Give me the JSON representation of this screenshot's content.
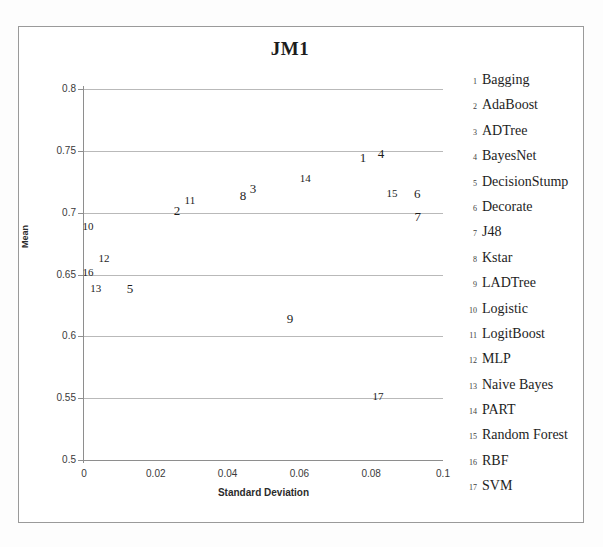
{
  "chart_data": {
    "type": "scatter",
    "title": "JM1",
    "xlabel": "Standard Deviation",
    "ylabel": "Mean",
    "xlim": [
      0,
      0.1
    ],
    "ylim": [
      0.5,
      0.8
    ],
    "xticks": [
      "0",
      "0.02",
      "0.04",
      "0.06",
      "0.08",
      "0.1"
    ],
    "xtick_values": [
      0,
      0.02,
      0.04,
      0.06,
      0.08,
      0.1
    ],
    "yticks": [
      "0.8",
      "0.75",
      "0.7",
      "0.65",
      "0.6",
      "0.55",
      "0.5"
    ],
    "ytick_values": [
      0.8,
      0.75,
      0.7,
      0.65,
      0.6,
      0.55,
      0.5
    ],
    "grid": true,
    "legend_position": "right",
    "marker_style": "numeric-label",
    "points": [
      {
        "key": "1",
        "name": "Bagging",
        "x": 0.0777,
        "y": 0.745
      },
      {
        "key": "2",
        "name": "AdaBoost",
        "x": 0.0259,
        "y": 0.702
      },
      {
        "key": "3",
        "name": "ADTree",
        "x": 0.0471,
        "y": 0.72
      },
      {
        "key": "4",
        "name": "BayesNet",
        "x": 0.0827,
        "y": 0.748
      },
      {
        "key": "5",
        "name": "DecisionStump",
        "x": 0.0128,
        "y": 0.639
      },
      {
        "key": "6",
        "name": "Decorate",
        "x": 0.0928,
        "y": 0.716
      },
      {
        "key": "7",
        "name": "J48",
        "x": 0.093,
        "y": 0.697
      },
      {
        "key": "8",
        "name": "Kstar",
        "x": 0.0443,
        "y": 0.714
      },
      {
        "key": "9",
        "name": "LADTree",
        "x": 0.0574,
        "y": 0.615
      },
      {
        "key": "10",
        "name": "Logistic",
        "x": 0.0011,
        "y": 0.689
      },
      {
        "key": "11",
        "name": "LogitBoost",
        "x": 0.0295,
        "y": 0.71
      },
      {
        "key": "12",
        "name": "MLP",
        "x": 0.0056,
        "y": 0.663
      },
      {
        "key": "13",
        "name": "Naive Bayes",
        "x": 0.0033,
        "y": 0.639
      },
      {
        "key": "14",
        "name": "PART",
        "x": 0.0616,
        "y": 0.728
      },
      {
        "key": "15",
        "name": "Random Forest",
        "x": 0.0858,
        "y": 0.716
      },
      {
        "key": "16",
        "name": "RBF",
        "x": 0.0011,
        "y": 0.652
      },
      {
        "key": "17",
        "name": "SVM",
        "x": 0.0819,
        "y": 0.552
      }
    ]
  },
  "legend": {
    "items": [
      {
        "key": "1",
        "label": "Bagging"
      },
      {
        "key": "2",
        "label": "AdaBoost"
      },
      {
        "key": "3",
        "label": "ADTree"
      },
      {
        "key": "4",
        "label": "BayesNet"
      },
      {
        "key": "5",
        "label": "DecisionStump"
      },
      {
        "key": "6",
        "label": "Decorate"
      },
      {
        "key": "7",
        "label": "J48"
      },
      {
        "key": "8",
        "label": "Kstar"
      },
      {
        "key": "9",
        "label": "LADTree"
      },
      {
        "key": "10",
        "label": "Logistic"
      },
      {
        "key": "11",
        "label": "LogitBoost"
      },
      {
        "key": "12",
        "label": "MLP"
      },
      {
        "key": "13",
        "label": "Naive Bayes"
      },
      {
        "key": "14",
        "label": "PART"
      },
      {
        "key": "15",
        "label": "Random Forest"
      },
      {
        "key": "16",
        "label": "RBF"
      },
      {
        "key": "17",
        "label": "SVM"
      }
    ]
  },
  "colors": {
    "background": "#ffffff",
    "frame": "#9a9a9a",
    "gridline": "#b9b9b9",
    "axis": "#8e8e8e",
    "text": "#1d1d1d"
  }
}
